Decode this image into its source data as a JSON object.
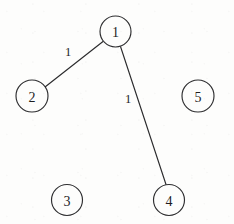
{
  "figure": {
    "kind": "undirected-weighted-graph",
    "background_color": "#fdfdfc",
    "stroke_color": "#2e2e30",
    "text_color": "#1d1d1f",
    "width": 234,
    "height": 224
  },
  "nodes": [
    {
      "id": "1",
      "label": "1",
      "cx": 115.5,
      "cy": 31.5,
      "r": 15.5
    },
    {
      "id": "2",
      "label": "2",
      "cx": 32,
      "cy": 96,
      "r": 16
    },
    {
      "id": "3",
      "label": "3",
      "cx": 67,
      "cy": 200,
      "r": 15.5
    },
    {
      "id": "4",
      "label": "4",
      "cx": 169,
      "cy": 200,
      "r": 15.5
    },
    {
      "id": "5",
      "label": "5",
      "cx": 198,
      "cy": 96,
      "r": 16
    }
  ],
  "edges": [
    {
      "id": "edge-1-2",
      "source": "1",
      "target": "2",
      "weight": "1",
      "x1": 103.0,
      "y1": 41.5,
      "x2": 45.0,
      "y2": 87.0,
      "label_x": 68,
      "label_y": 52
    },
    {
      "id": "edge-1-4",
      "source": "1",
      "target": "4",
      "weight": "1",
      "x1": 120.5,
      "y1": 46.5,
      "x2": 166.0,
      "y2": 184.5,
      "label_x": 128,
      "label_y": 99
    }
  ],
  "isolated_nodes": [
    "3",
    "5"
  ]
}
